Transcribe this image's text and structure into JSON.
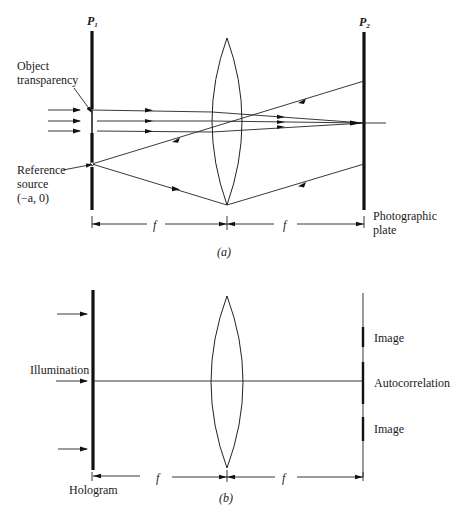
{
  "diagram_a": {
    "caption": "(a)",
    "plane1_label": "P",
    "plane1_sub": "1",
    "plane2_label": "P",
    "plane2_sub": "2",
    "object_label_line1": "Object",
    "object_label_line2": "transparency",
    "reference_label_line1": "Reference",
    "reference_label_line2": "source",
    "reference_label_line3": "(−a, 0)",
    "plate_label_line1": "Photographic",
    "plate_label_line2": "plate",
    "dim_left": "f",
    "dim_right": "f"
  },
  "diagram_b": {
    "caption": "(b)",
    "illumination_label": "Illumination",
    "hologram_label": "Hologram",
    "image_top_label": "Image",
    "autocorrelation_label": "Autocorrelation",
    "image_bottom_label": "Image",
    "dim_left": "f",
    "dim_right": "f"
  },
  "colors": {
    "ink": "#111111",
    "background": "#ffffff"
  }
}
